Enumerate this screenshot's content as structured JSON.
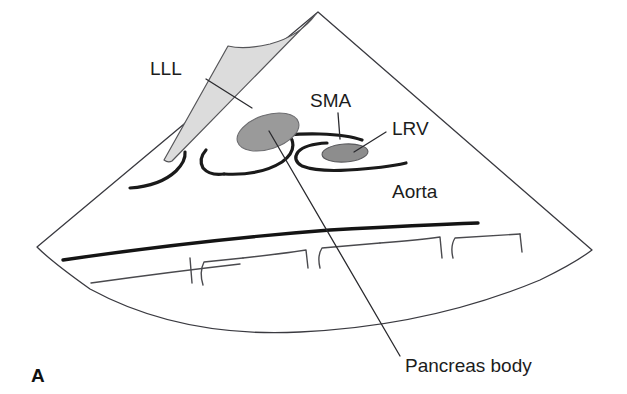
{
  "figure": {
    "panel_letter": "A"
  },
  "labels": [
    {
      "id": "lll",
      "text": "LLL",
      "meaning": "left lobe of liver",
      "x": 150,
      "y": 75,
      "anchor": "start"
    },
    {
      "id": "sma",
      "text": "SMA",
      "meaning": "superior mesenteric artery",
      "x": 310,
      "y": 107,
      "anchor": "start"
    },
    {
      "id": "lrv",
      "text": "LRV",
      "meaning": "left renal vein",
      "x": 392,
      "y": 135,
      "anchor": "start"
    },
    {
      "id": "aorta",
      "text": "Aorta",
      "meaning": "abdominal aorta",
      "x": 392,
      "y": 198,
      "anchor": "start"
    },
    {
      "id": "pancreas-body",
      "text": "Pancreas body",
      "meaning": "body of the pancreas",
      "x": 405,
      "y": 372,
      "anchor": "start"
    }
  ],
  "colors": {
    "background": "#ffffff",
    "liver_fill": "#dcdcdc",
    "pancreas_fill": "#9a9a9a",
    "lrv_fill": "#8d8d8d",
    "outline": "#3a3a40",
    "vessel": "#1a1a1a",
    "text": "#1c1c1c"
  },
  "geometry": {
    "sector_apex": {
      "x": 318,
      "y": 12
    },
    "sector_left_corner": {
      "x": 37,
      "y": 247
    },
    "sector_right_corner": {
      "x": 592,
      "y": 250
    },
    "sector_arc_bottom": {
      "x": 300,
      "y": 332
    }
  }
}
